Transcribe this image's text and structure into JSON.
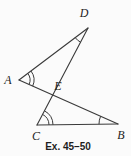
{
  "diagram": {
    "caption": "Ex. 45–50",
    "labels": {
      "A": "A",
      "B": "B",
      "C": "C",
      "D": "D",
      "E": "E"
    },
    "points": {
      "A": [
        19,
        80
      ],
      "B": [
        118,
        124
      ],
      "C": [
        37,
        125
      ],
      "D": [
        88,
        28
      ],
      "E": [
        52.7,
        94.9
      ]
    },
    "segments": [
      [
        "A",
        "D"
      ],
      [
        "D",
        "C"
      ],
      [
        "A",
        "B"
      ],
      [
        "C",
        "B"
      ]
    ],
    "angle_marks": [
      {
        "vertex": "D",
        "arcs": 1
      },
      {
        "vertex": "A",
        "arcs": 2
      },
      {
        "vertex": "C",
        "arcs": 2
      },
      {
        "vertex": "B",
        "arcs": 1
      }
    ],
    "colors": {
      "line": "#3a3a3a",
      "label": "#1e1e1e",
      "background": "#fbfbfb"
    }
  }
}
